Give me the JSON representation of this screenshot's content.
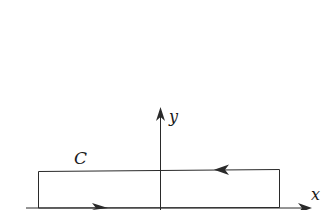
{
  "diagram": {
    "type": "contour-in-plane",
    "labels": {
      "contour": "C",
      "x_axis": "x",
      "y_axis": "y"
    },
    "colors": {
      "stroke": "#2a2a2a",
      "background": "#ffffff"
    },
    "contour": {
      "shape": "rectangle",
      "orientation": "counterclockwise",
      "arrows": [
        "bottom edge pointing right",
        "top edge pointing left"
      ]
    }
  }
}
